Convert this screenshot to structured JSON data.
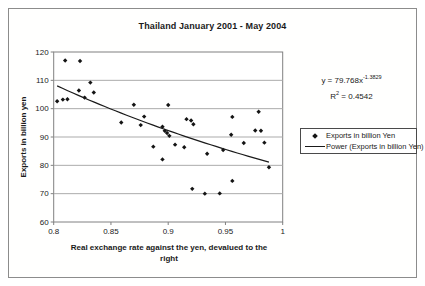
{
  "figure": {
    "equation": {
      "base": "y = 79.768x",
      "exponent": "-1.3829",
      "r2_lead": "R",
      "r2_sup": "2",
      "r2_tail": " = 0.4542"
    },
    "xlabel_lines": [
      "Real exchange rate against the yen, devalued to the",
      "right"
    ]
  },
  "chart_data": {
    "type": "scatter",
    "title": "Thailand January 2001 - May 2004",
    "xlabel": "Real exchange rate against the yen, devalued to the right",
    "ylabel": "Exports in billion yen",
    "xlim": [
      0.8,
      1.0
    ],
    "ylim": [
      60,
      120
    ],
    "xticks": [
      0.8,
      0.85,
      0.9,
      0.95,
      1
    ],
    "xtick_labels": [
      "0.8",
      "0.85",
      "0.9",
      "0.95",
      "1"
    ],
    "yticks": [
      60,
      70,
      80,
      90,
      100,
      110,
      120
    ],
    "ytick_labels": [
      "60",
      "70",
      "80",
      "90",
      "100",
      "110",
      "120"
    ],
    "grid": "horizontal-only",
    "legend_position": "right",
    "colors": {
      "points": "#141414",
      "trendline": "#1a1a1a",
      "gridline": "#ababab",
      "plot_border": "#808080"
    },
    "series": [
      {
        "name": "Exports in billion Yen",
        "type": "scatter",
        "marker": "diamond",
        "color": "#141414",
        "points": [
          [
            0.81,
            117.0
          ],
          [
            0.823,
            116.8
          ],
          [
            0.803,
            102.6
          ],
          [
            0.808,
            103.2
          ],
          [
            0.812,
            103.3
          ],
          [
            0.822,
            106.4
          ],
          [
            0.827,
            103.9
          ],
          [
            0.832,
            109.2
          ],
          [
            0.835,
            105.7
          ],
          [
            0.859,
            95.1
          ],
          [
            0.87,
            101.4
          ],
          [
            0.876,
            94.2
          ],
          [
            0.879,
            97.2
          ],
          [
            0.887,
            86.6
          ],
          [
            0.895,
            82.1
          ],
          [
            0.895,
            93.6
          ],
          [
            0.897,
            92.2
          ],
          [
            0.899,
            91.4
          ],
          [
            0.901,
            90.4
          ],
          [
            0.9,
            101.3
          ],
          [
            0.906,
            87.3
          ],
          [
            0.914,
            86.4
          ],
          [
            0.916,
            96.3
          ],
          [
            0.92,
            95.8
          ],
          [
            0.922,
            94.5
          ],
          [
            0.921,
            71.7
          ],
          [
            0.932,
            70.0
          ],
          [
            0.934,
            84.1
          ],
          [
            0.945,
            70.1
          ],
          [
            0.948,
            85.4
          ],
          [
            0.955,
            90.8
          ],
          [
            0.956,
            97.1
          ],
          [
            0.956,
            74.5
          ],
          [
            0.966,
            87.9
          ],
          [
            0.976,
            92.3
          ],
          [
            0.979,
            98.9
          ],
          [
            0.981,
            92.2
          ],
          [
            0.984,
            88.0
          ],
          [
            0.988,
            79.3
          ]
        ]
      },
      {
        "name": "Power (Exports in billion Yen)",
        "type": "power_trendline",
        "color": "#1a1a1a",
        "coefficient": 79.768,
        "exponent": -1.3829,
        "r_squared": 0.4542,
        "x_range": [
          0.803,
          0.988
        ]
      }
    ]
  }
}
